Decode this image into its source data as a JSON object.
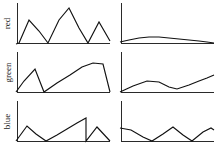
{
  "figure": {
    "title": "",
    "rows": [
      "red",
      "green",
      "blue"
    ],
    "columns": [
      "left",
      "right"
    ],
    "background": "#ffffff",
    "line_color": "#111111",
    "axis_color": "#2a2a2a"
  },
  "labels": {
    "red": "red",
    "green": "green",
    "blue": "blue"
  },
  "chart_data": [
    {
      "type": "line",
      "title": "",
      "name": "red-left",
      "row": "red",
      "column": "left",
      "xlabel": "",
      "ylabel": "red",
      "grid": false,
      "legend": "none",
      "xlim": [
        0,
        10
      ],
      "ylim": [
        0,
        10
      ],
      "x": [
        0,
        1,
        2,
        3,
        4,
        5,
        6,
        7,
        8,
        9,
        10
      ],
      "values": [
        0.2,
        0.3,
        4.0,
        2.5,
        0.5,
        4.0,
        8.0,
        3.5,
        0.4,
        4.2,
        0.6
      ],
      "axis_style": "L-shape",
      "polyline_points": "1,44 4,43 14,20 24,31 33,43 44,20 54,8 64,28 73,43 84,22 95,41"
    },
    {
      "type": "line",
      "title": "",
      "name": "red-right",
      "row": "red",
      "column": "right",
      "xlabel": "",
      "ylabel": "red",
      "grid": false,
      "legend": "none",
      "xlim": [
        0,
        10
      ],
      "ylim": [
        0,
        10
      ],
      "x": [
        0,
        1,
        2,
        3,
        4,
        5,
        6,
        7,
        8,
        9,
        10
      ],
      "values": [
        0.6,
        0.9,
        1.3,
        1.4,
        1.3,
        1.1,
        0.9,
        0.7,
        0.5,
        0.3,
        0.1
      ],
      "axis_style": "L-shape",
      "polyline_points": "1,42 10,40 20,38 30,37 40,37 50,38 60,39 70,40 80,41 88,42 95,43"
    },
    {
      "type": "line",
      "title": "",
      "name": "green-left",
      "row": "green",
      "column": "left",
      "xlabel": "",
      "ylabel": "green",
      "grid": false,
      "legend": "none",
      "xlim": [
        0,
        10
      ],
      "ylim": [
        0,
        10
      ],
      "x": [
        0,
        1,
        2,
        3,
        4,
        5,
        6,
        7,
        8,
        9,
        10
      ],
      "values": [
        0.2,
        2.0,
        4.0,
        0.3,
        2.5,
        4.5,
        6.5,
        8.0,
        8.0,
        7.8,
        0.3
      ],
      "axis_style": "L-shape",
      "polyline_points": "1,43 9,32 20,20 29,43 42,34 55,26 67,18 78,14 88,15 95,43"
    },
    {
      "type": "line",
      "title": "",
      "name": "green-right",
      "row": "green",
      "column": "right",
      "xlabel": "",
      "ylabel": "green",
      "grid": false,
      "legend": "none",
      "xlim": [
        0,
        10
      ],
      "ylim": [
        0,
        10
      ],
      "x": [
        0,
        1,
        2,
        3,
        4,
        5,
        6,
        7,
        8,
        9,
        10
      ],
      "values": [
        0.4,
        1.2,
        1.8,
        1.5,
        0.9,
        0.7,
        1.2,
        1.8,
        2.4,
        3.0,
        3.4
      ],
      "axis_style": "L-shape",
      "polyline_points": "1,43 14,37 28,32 40,33 50,38 58,40 70,36 80,32 88,29 95,26"
    },
    {
      "type": "line",
      "title": "",
      "name": "blue-left",
      "row": "blue",
      "column": "left",
      "xlabel": "",
      "ylabel": "blue",
      "grid": false,
      "legend": "none",
      "xlim": [
        0,
        10
      ],
      "ylim": [
        0,
        10
      ],
      "x": [
        0,
        1,
        2,
        3,
        4,
        5,
        6,
        7,
        8,
        9,
        10
      ],
      "values": [
        0.2,
        3.5,
        1.8,
        0.4,
        2.2,
        3.6,
        5.0,
        6.4,
        0.3,
        3.4,
        0.5
      ],
      "axis_style": "L-shape",
      "polyline_points": "1,43 12,28 21,36 31,43 42,37 52,31 62,25 71,20 71,43 82,29 95,43"
    },
    {
      "type": "line",
      "title": "",
      "name": "blue-right",
      "row": "blue",
      "column": "right",
      "xlabel": "",
      "ylabel": "blue",
      "grid": false,
      "legend": "none",
      "xlim": [
        0,
        10
      ],
      "ylim": [
        0,
        10
      ],
      "x": [
        0,
        1,
        2,
        3,
        4,
        5,
        6,
        7,
        8,
        9,
        10
      ],
      "values": [
        3.0,
        2.4,
        1.0,
        0.3,
        1.5,
        2.6,
        1.4,
        0.4,
        1.6,
        2.6,
        2.0
      ],
      "axis_style": "L-shape",
      "polyline_points": "1,30 12,32 24,39 33,43 44,36 54,29 64,37 73,43 84,34 92,30 95,32"
    }
  ]
}
